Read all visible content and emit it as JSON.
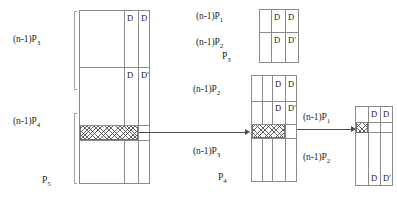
{
  "figure": {
    "stroke_color": "#8a8a8a",
    "text_color": "#1c1c1c",
    "arrow_color": "#4d4d4d",
    "hatch_color": "#464646",
    "background": "#ffffff"
  },
  "labels": {
    "left": [
      {
        "id": "left-label-1",
        "text": "(n-1)P",
        "sub": "3"
      },
      {
        "id": "left-label-2",
        "text": "(n-1)P",
        "sub": "4"
      },
      {
        "id": "left-label-3",
        "text": "P",
        "sub": "5"
      }
    ],
    "middle_top": [
      {
        "id": "mid-top-label-1",
        "text": "(n-1)P",
        "sub": "1"
      },
      {
        "id": "mid-top-label-2",
        "text": "(n-1)P",
        "sub": "2"
      },
      {
        "id": "mid-top-label-3",
        "text": "P",
        "sub": "3"
      }
    ],
    "middle_bottom": [
      {
        "id": "mid-bot-label-1",
        "text": "(n-1)P",
        "sub": "2"
      },
      {
        "id": "mid-bot-label-2",
        "text": "(n-1)P",
        "sub": "3"
      },
      {
        "id": "mid-bot-label-3",
        "text": "P",
        "sub": "4"
      }
    ],
    "right": [
      {
        "id": "right-label-1",
        "text": "(n-1)P",
        "sub": "1"
      },
      {
        "id": "right-label-2",
        "text": "(n-1)P",
        "sub": "2"
      }
    ]
  },
  "cells": {
    "left_box": [
      {
        "id": "left-d-1",
        "text": "D"
      },
      {
        "id": "left-d-2",
        "text": "D"
      },
      {
        "id": "left-d-3",
        "text": "D"
      },
      {
        "id": "left-d-4",
        "text": "D'"
      }
    ],
    "mid_top_box": [
      {
        "id": "midtop-d-1",
        "text": "D"
      },
      {
        "id": "midtop-d-2",
        "text": "D"
      },
      {
        "id": "midtop-d-3",
        "text": "D"
      },
      {
        "id": "midtop-d-4",
        "text": "D'"
      }
    ],
    "mid_bottom_box": [
      {
        "id": "midbot-d-1",
        "text": "D"
      },
      {
        "id": "midbot-d-2",
        "text": "D"
      },
      {
        "id": "midbot-d-3",
        "text": "D"
      },
      {
        "id": "midbot-d-4",
        "text": "D'"
      }
    ],
    "right_box": [
      {
        "id": "right-d-1",
        "text": "D"
      },
      {
        "id": "right-d-2",
        "text": "D"
      },
      {
        "id": "right-d-3",
        "text": "D"
      },
      {
        "id": "right-d-4",
        "text": "D'"
      }
    ]
  }
}
